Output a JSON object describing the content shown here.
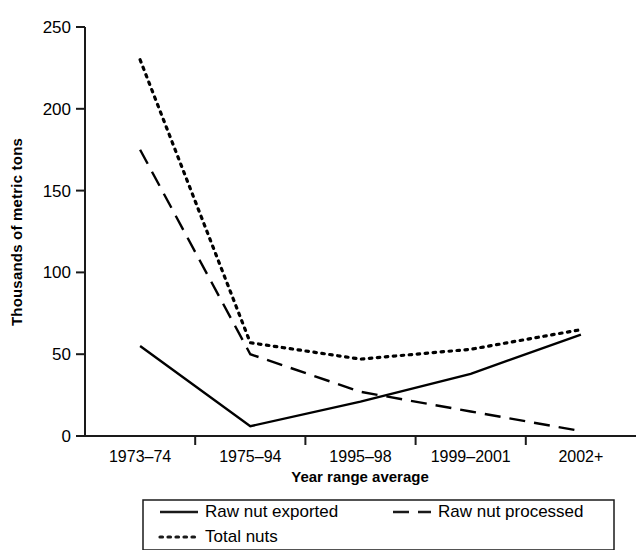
{
  "chart_data": {
    "type": "line",
    "title": "",
    "xlabel": "Year range average",
    "ylabel": "Thousands of metric tons",
    "categories": [
      "1973–74",
      "1975–94",
      "1995–98",
      "1999–2001",
      "2002+"
    ],
    "ylim": [
      0,
      250
    ],
    "yticks": [
      0,
      50,
      100,
      150,
      200,
      250
    ],
    "ytick_labels": [
      "0",
      "50",
      "100",
      "150",
      "200",
      "250"
    ],
    "grid": false,
    "legend_position": "bottom",
    "series": [
      {
        "name": "Raw nut exported",
        "style": "solid",
        "color": "#000000",
        "values": [
          55,
          6,
          21,
          38,
          62
        ]
      },
      {
        "name": "Raw nut processed",
        "style": "dashed",
        "color": "#000000",
        "values": [
          175,
          50,
          27,
          15,
          3
        ]
      },
      {
        "name": "Total nuts",
        "style": "dotted",
        "color": "#000000",
        "values": [
          230,
          57,
          47,
          53,
          65
        ]
      }
    ]
  },
  "legend": {
    "items": [
      {
        "label": "Raw nut exported",
        "style": "solid"
      },
      {
        "label": "Raw nut processed",
        "style": "dashed"
      },
      {
        "label": "Total nuts",
        "style": "dotted"
      }
    ]
  },
  "axis": {
    "y_title": "Thousands of metric tons",
    "x_title": "Year range average"
  }
}
